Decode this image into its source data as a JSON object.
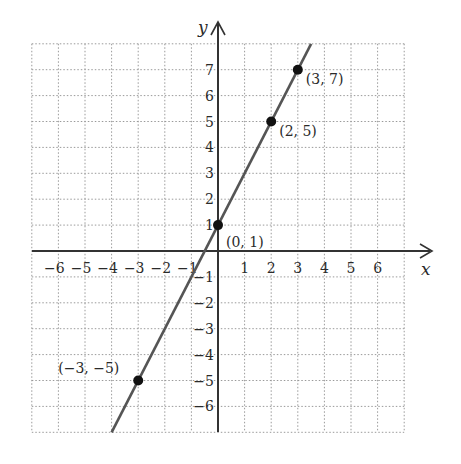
{
  "chart_data": {
    "type": "line",
    "title": "",
    "xlabel": "x",
    "ylabel": "y",
    "xlim": [
      -7,
      7
    ],
    "ylim": [
      -7,
      8
    ],
    "grid": true,
    "x_ticks": [
      "−6",
      "−5",
      "−4",
      "−3",
      "−2",
      "−1",
      "1",
      "2",
      "3",
      "4",
      "5",
      "6"
    ],
    "y_ticks": [
      "7",
      "6",
      "5",
      "4",
      "3",
      "2",
      "1",
      "−1",
      "−2",
      "−3",
      "−4",
      "−5",
      "−6"
    ],
    "series": [
      {
        "name": "y = 2x + 1",
        "line_color": "#555555",
        "line_endpoints": [
          [
            -4,
            -7
          ],
          [
            3.5,
            8
          ]
        ],
        "points": [
          {
            "x": -3,
            "y": -5,
            "label": "(−3, −5)"
          },
          {
            "x": 0,
            "y": 1,
            "label": "(0, 1)"
          },
          {
            "x": 2,
            "y": 5,
            "label": "(2, 5)"
          },
          {
            "x": 3,
            "y": 7,
            "label": "(3, 7)"
          }
        ]
      }
    ]
  }
}
